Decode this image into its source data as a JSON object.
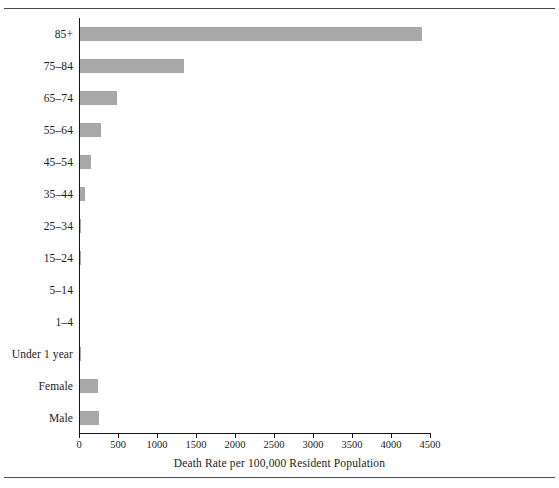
{
  "figure": {
    "background_color": "#ffffff",
    "rule_color": "#4a4a4a",
    "axis_color": "#141414"
  },
  "chart_data": {
    "type": "bar",
    "orientation": "horizontal",
    "title": "",
    "xlabel": "Death Rate per 100,000 Resident Population",
    "ylabel": "",
    "xlim": [
      0,
      4500
    ],
    "ylim": null,
    "grid": false,
    "legend": null,
    "bar_color": "#a8a8a8",
    "xticks": [
      0,
      500,
      1000,
      1500,
      2000,
      2500,
      3000,
      3500,
      4000,
      4500
    ],
    "xtick_labels": [
      "0",
      "500",
      "1000",
      "1500",
      "2000",
      "2500",
      "3000",
      "3500",
      "4000",
      "4500"
    ],
    "categories": [
      "85+",
      "75–84",
      "65–74",
      "55–64",
      "45–54",
      "35–44",
      "25–34",
      "15–24",
      "5–14",
      "1–4",
      "Under 1 year",
      "Female",
      "Male"
    ],
    "values": [
      4380,
      1330,
      475,
      265,
      140,
      60,
      18,
      6,
      3,
      4,
      12,
      235,
      240
    ]
  }
}
